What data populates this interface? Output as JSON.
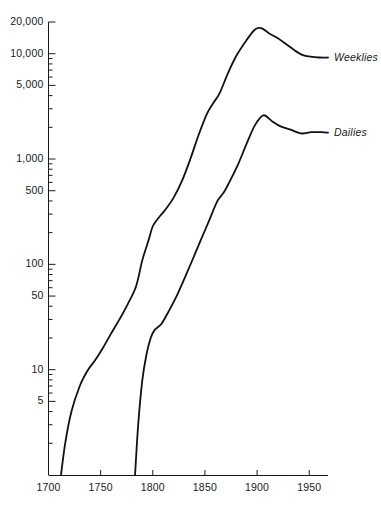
{
  "chart_data": {
    "type": "line",
    "title": "",
    "subtitle": "",
    "xlabel": "",
    "ylabel": "",
    "yscale": "log",
    "xlim": [
      1700,
      1968
    ],
    "ylim": [
      1,
      20000
    ],
    "grid": false,
    "legend_position": "right-inline",
    "x_ticks": [
      1700,
      1750,
      1800,
      1850,
      1900,
      1950
    ],
    "x_tick_labels": [
      "1700",
      "1750",
      "1800",
      "1850",
      "1900",
      "1950"
    ],
    "y_ticks": [
      5,
      10,
      50,
      100,
      500,
      1000,
      5000,
      10000,
      20000
    ],
    "y_tick_labels": [
      "5",
      "10",
      "50",
      "100",
      "500",
      "1,000",
      "5,000",
      "10,000",
      "20,000"
    ],
    "y_minor_ticks": [
      2,
      3,
      4,
      6,
      7,
      8,
      9,
      20,
      30,
      40,
      60,
      70,
      80,
      90,
      200,
      300,
      400,
      600,
      700,
      800,
      900,
      2000,
      3000,
      4000,
      6000,
      7000,
      8000,
      9000
    ],
    "series": [
      {
        "name": "Weeklies",
        "label": "Weeklies",
        "color": "#111111",
        "points": [
          [
            1712,
            1
          ],
          [
            1716,
            2
          ],
          [
            1722,
            4
          ],
          [
            1730,
            7
          ],
          [
            1738,
            10
          ],
          [
            1744,
            12
          ],
          [
            1752,
            16
          ],
          [
            1760,
            22
          ],
          [
            1768,
            30
          ],
          [
            1776,
            42
          ],
          [
            1784,
            62
          ],
          [
            1790,
            110
          ],
          [
            1796,
            170
          ],
          [
            1800,
            230
          ],
          [
            1806,
            280
          ],
          [
            1812,
            330
          ],
          [
            1820,
            430
          ],
          [
            1828,
            620
          ],
          [
            1836,
            1000
          ],
          [
            1844,
            1700
          ],
          [
            1852,
            2700
          ],
          [
            1858,
            3400
          ],
          [
            1864,
            4200
          ],
          [
            1872,
            6500
          ],
          [
            1880,
            9500
          ],
          [
            1890,
            13500
          ],
          [
            1898,
            17000
          ],
          [
            1904,
            17500
          ],
          [
            1912,
            15500
          ],
          [
            1920,
            14000
          ],
          [
            1932,
            11500
          ],
          [
            1944,
            9700
          ],
          [
            1960,
            9200
          ],
          [
            1968,
            9200
          ]
        ]
      },
      {
        "name": "Dailies",
        "label": "Dailies",
        "color": "#111111",
        "points": [
          [
            1783,
            1
          ],
          [
            1786,
            3
          ],
          [
            1790,
            8
          ],
          [
            1794,
            14
          ],
          [
            1798,
            20
          ],
          [
            1802,
            24
          ],
          [
            1808,
            27
          ],
          [
            1814,
            34
          ],
          [
            1822,
            48
          ],
          [
            1830,
            72
          ],
          [
            1838,
            110
          ],
          [
            1846,
            170
          ],
          [
            1854,
            260
          ],
          [
            1862,
            400
          ],
          [
            1868,
            480
          ],
          [
            1874,
            620
          ],
          [
            1882,
            900
          ],
          [
            1890,
            1400
          ],
          [
            1898,
            2100
          ],
          [
            1906,
            2600
          ],
          [
            1914,
            2300
          ],
          [
            1922,
            2050
          ],
          [
            1932,
            1900
          ],
          [
            1942,
            1750
          ],
          [
            1952,
            1800
          ],
          [
            1962,
            1800
          ],
          [
            1968,
            1780
          ]
        ]
      }
    ],
    "annotations": []
  },
  "axis": {
    "y_axis_name": "y-axis-log-scale",
    "x_axis_name": "x-axis-years"
  }
}
